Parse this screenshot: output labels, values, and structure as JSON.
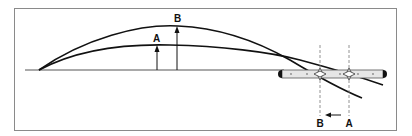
{
  "diagram": {
    "labels": {
      "arrow_a": "A",
      "arrow_b": "B",
      "sight_a": "A",
      "sight_b": "B"
    },
    "colors": {
      "line": "#111111",
      "frame": "#8a8a8a",
      "tube_fill": "#e6e6e6",
      "dashed": "#777777"
    },
    "elements": [
      "baseline",
      "trajectory-a (lower arc)",
      "trajectory-b (higher arc)",
      "height-arrow-a",
      "height-arrow-b",
      "sight-tube",
      "crosshair-marker-b",
      "crosshair-marker-a",
      "sight-line-b (dashed)",
      "sight-line-a (dashed)",
      "shift-arrow (A to B)"
    ]
  }
}
